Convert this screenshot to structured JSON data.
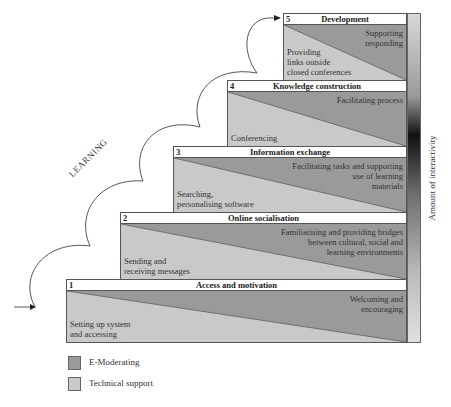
{
  "colors": {
    "e_moderating": "#9a9a9a",
    "technical_support": "#c9c9c9",
    "header_bg": "#ffffff"
  },
  "learning_label": "LEARNING",
  "axis_label": "Amount of interactivity",
  "steps": [
    {
      "num": "1",
      "title": "Access and motivation",
      "e_moderating": "Welcoming and\nencouraging",
      "technical": "Setting up system\nand accessing"
    },
    {
      "num": "2",
      "title": "Online socialisation",
      "e_moderating": "Familiarising and providing bridges\nbetween cultural, social and\nlearning environments",
      "technical": "Sending and\nreceiving messages"
    },
    {
      "num": "3",
      "title": "Information exchange",
      "e_moderating": "Facilitating tasks and supporting\nuse of learning\nmaterials",
      "technical": "Searching,\npersonalising software"
    },
    {
      "num": "4",
      "title": "Knowledge construction",
      "e_moderating": "Facilitating process",
      "technical": "Conferencing"
    },
    {
      "num": "5",
      "title": "Development",
      "e_moderating": "Supporting\nresponding",
      "technical": "Providing\nlinks outside\nclosed conferences"
    }
  ],
  "legend": [
    {
      "label": "E-Moderating",
      "color": "#9a9a9a"
    },
    {
      "label": "Technical support",
      "color": "#c9c9c9"
    }
  ]
}
